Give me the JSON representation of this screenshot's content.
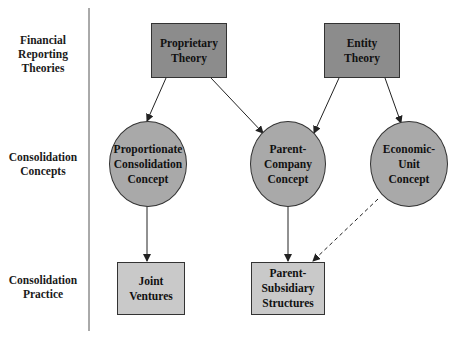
{
  "row_labels": {
    "theories": "Financial\nReporting\nTheories",
    "concepts": "Consolidation\nConcepts",
    "practice": "Consolidation\nPractice"
  },
  "nodes": {
    "proprietary_theory": "Proprietary\nTheory",
    "entity_theory": "Entity\nTheory",
    "proportionate_concept": "Proportionate\nConsolidation\nConcept",
    "parent_company_concept": "Parent-\nCompany\nConcept",
    "economic_unit_concept": "Economic-\nUnit\nConcept",
    "joint_ventures": "Joint\nVentures",
    "parent_subsidiary": "Parent-\nSubsidiary\nStructures"
  },
  "edges": [
    {
      "from": "proprietary_theory",
      "to": "proportionate_concept",
      "style": "solid"
    },
    {
      "from": "proprietary_theory",
      "to": "parent_company_concept",
      "style": "solid"
    },
    {
      "from": "entity_theory",
      "to": "parent_company_concept",
      "style": "solid"
    },
    {
      "from": "entity_theory",
      "to": "economic_unit_concept",
      "style": "solid"
    },
    {
      "from": "proportionate_concept",
      "to": "joint_ventures",
      "style": "solid"
    },
    {
      "from": "parent_company_concept",
      "to": "parent_subsidiary",
      "style": "solid"
    },
    {
      "from": "economic_unit_concept",
      "to": "parent_subsidiary",
      "style": "dashed"
    }
  ],
  "colors": {
    "theory_fill": "#8c8c8c",
    "concept_fill": "#a9a9a9",
    "practice_fill": "#c9c9c9",
    "line": "#333333"
  }
}
